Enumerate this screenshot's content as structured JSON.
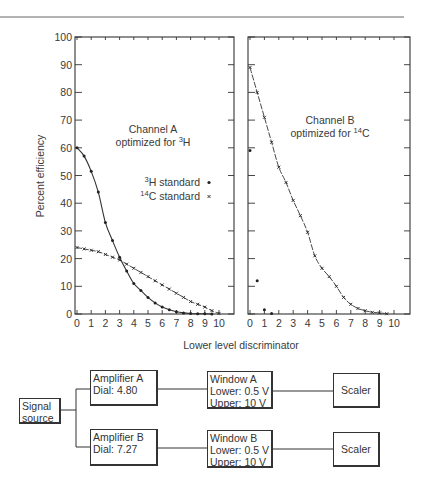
{
  "chart_data": [
    {
      "type": "line",
      "panel": "left",
      "title": "Channel A optimized for 3H",
      "annotation": {
        "line1": "Channel A",
        "line2_prefix": "optimized for ",
        "line2_sup": "3",
        "line2_suffix": "H"
      },
      "xlabel": "Lower level discriminator",
      "ylabel": "Percent efficiency",
      "xlim": [
        0,
        10
      ],
      "ylim": [
        0,
        100
      ],
      "xticks": [
        "0",
        "1",
        "2",
        "3",
        "4",
        "5",
        "6",
        "7",
        "8",
        "9",
        "10"
      ],
      "yticks": [
        "0",
        "10",
        "20",
        "30",
        "40",
        "50",
        "60",
        "70",
        "80",
        "90",
        "100"
      ],
      "legend": [
        {
          "sup": "3",
          "label": "H standard",
          "marker": "dot"
        },
        {
          "sup": "14",
          "label": "C standard",
          "marker": "x"
        }
      ],
      "series": [
        {
          "name": "3H standard",
          "x": [
            0,
            0.5,
            1.0,
            1.5,
            2.0,
            2.5,
            3.0,
            3.5,
            4.0,
            4.5,
            5.0,
            5.5,
            6.0,
            6.5,
            7.0,
            7.5,
            8.0,
            8.5,
            9.0,
            9.5
          ],
          "y": [
            60,
            57,
            51.5,
            44,
            33,
            26.5,
            20.5,
            15.5,
            11,
            8.5,
            6,
            4,
            2.5,
            1.5,
            0.8,
            0.4,
            0.2,
            0.1,
            0.1,
            0
          ]
        },
        {
          "name": "14C standard",
          "x": [
            0,
            0.5,
            1.0,
            1.5,
            2.0,
            2.5,
            3.0,
            3.5,
            4.0,
            4.5,
            5.0,
            5.5,
            6.0,
            6.5,
            7.0,
            7.5,
            8.0,
            8.5,
            9.0,
            9.5,
            10.0
          ],
          "y": [
            24,
            23.5,
            23,
            22.5,
            21.5,
            20.5,
            19.5,
            18,
            16.5,
            15,
            13.5,
            12,
            10.5,
            9,
            7.5,
            6,
            4.5,
            3.5,
            2.5,
            1.2,
            0.2
          ]
        }
      ]
    },
    {
      "type": "line",
      "panel": "right",
      "title": "Channel B optimized for 14C",
      "annotation": {
        "line1": "Channel B",
        "line2_prefix": "optimized for ",
        "line2_sup": "14",
        "line2_suffix": "C"
      },
      "xlabel": "Lower level discriminator",
      "xlim": [
        0,
        10
      ],
      "ylim": [
        0,
        100
      ],
      "xticks": [
        "0",
        "1",
        "2",
        "3",
        "4",
        "5",
        "6",
        "7",
        "8",
        "9",
        "10"
      ],
      "series": [
        {
          "name": "14C standard",
          "x": [
            0,
            0.5,
            1.0,
            1.5,
            2.0,
            2.5,
            3.0,
            3.5,
            4.0,
            4.5,
            5.0,
            5.5,
            6.0,
            6.5,
            7.0,
            7.5,
            8.0,
            8.5,
            9.0,
            9.5
          ],
          "y": [
            89,
            80,
            71,
            62,
            53,
            47.5,
            41,
            35.5,
            29.5,
            21,
            16.5,
            13.5,
            10,
            6,
            3.5,
            2,
            1.2,
            0.6,
            0.4,
            0.1
          ]
        },
        {
          "name": "3H standard",
          "x": [
            0,
            0.5,
            1.0,
            1.5
          ],
          "y": [
            59,
            12,
            1.5,
            0.2
          ]
        }
      ]
    }
  ],
  "diagram": {
    "signal_source": {
      "line1": "Signal",
      "line2": "source"
    },
    "amplifier_a": {
      "line1": "Amplifier A",
      "line2": "Dial: 4.80"
    },
    "amplifier_b": {
      "line1": "Amplifier B",
      "line2": "Dial: 7.27"
    },
    "window_a": {
      "line1": "Window A",
      "line2": "Lower: 0.5 V",
      "line3": "Upper: 10 V"
    },
    "window_b": {
      "line1": "Window B",
      "line2": "Lower: 0.5 V",
      "line3": "Upper: 10 V"
    },
    "scaler_a": {
      "label": "Scaler"
    },
    "scaler_b": {
      "label": "Scaler"
    }
  },
  "colors": {
    "ink": "#2a2a2a",
    "background": "#ffffff",
    "rule": "#555555"
  }
}
